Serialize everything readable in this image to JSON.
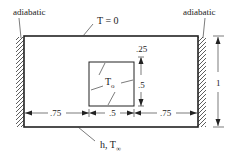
{
  "diagram": {
    "type": "2D conduction domain with embedded heated square",
    "labels": {
      "adiabatic_left": "adiabatic",
      "adiabatic_right": "adiabatic",
      "top_boundary": "T = 0",
      "inner_temperature": "T",
      "inner_temperature_sub": "o",
      "bottom_boundary_h": "h, T",
      "bottom_boundary_sub": "∞"
    },
    "dimensions": {
      "top_gap": ".25",
      "inner_height": ".5",
      "left_width": ".75",
      "inner_width": ".5",
      "right_width": ".75",
      "total_height": "1"
    },
    "colors": {
      "line": "#222222",
      "background": "#ffffff"
    }
  }
}
